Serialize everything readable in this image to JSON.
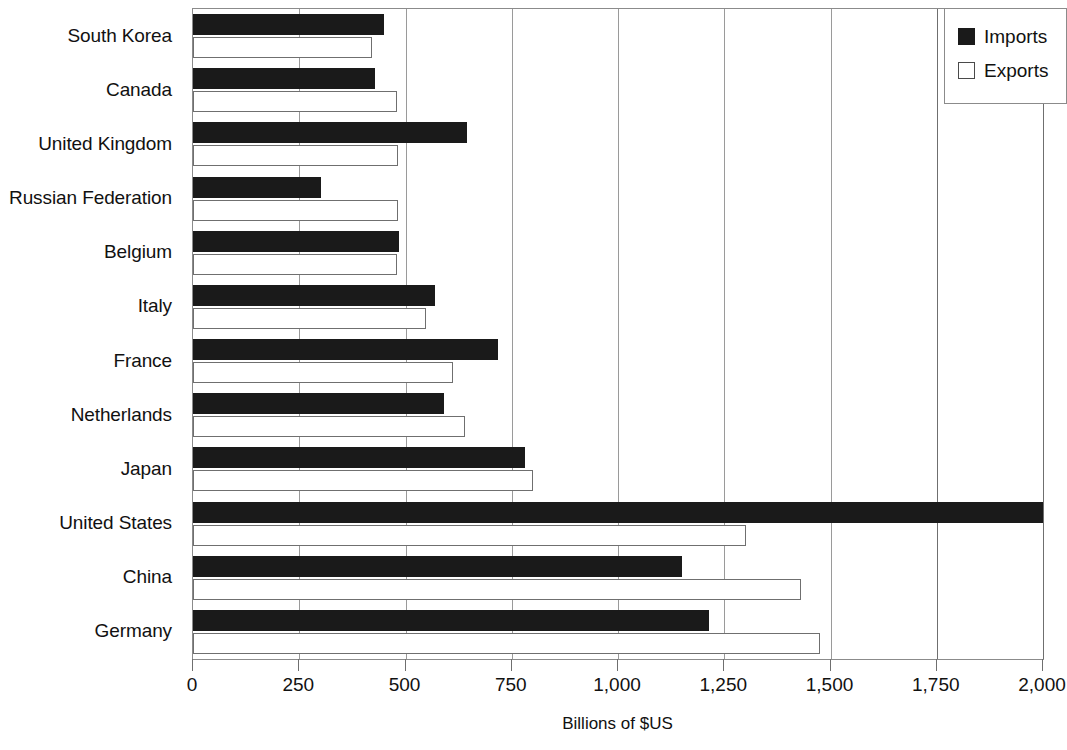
{
  "chart_data": {
    "type": "bar",
    "orientation": "horizontal",
    "title": "",
    "xlabel": "Billions of $US",
    "ylabel": "",
    "xlim": [
      0,
      2000
    ],
    "xticks": [
      0,
      250,
      500,
      750,
      1000,
      1250,
      1500,
      1750,
      2000
    ],
    "xtick_labels": [
      "0",
      "250",
      "500",
      "750",
      "1,000",
      "1,250",
      "1,500",
      "1,750",
      "2,000"
    ],
    "grid": true,
    "grid_axis": "x",
    "legend_position": "top-right",
    "categories": [
      "South Korea",
      "Canada",
      "United Kingdom",
      "Russian Federation",
      "Belgium",
      "Italy",
      "France",
      "Netherlands",
      "Japan",
      "United States",
      "China",
      "Germany"
    ],
    "series": [
      {
        "name": "Imports",
        "color": "#1a1a1a",
        "style": "filled",
        "values": [
          450,
          428,
          645,
          302,
          485,
          570,
          718,
          590,
          782,
          2000,
          1150,
          1215
        ]
      },
      {
        "name": "Exports",
        "color": "#ffffff",
        "style": "hollow",
        "values": [
          420,
          480,
          483,
          482,
          480,
          548,
          611,
          640,
          800,
          1300,
          1430,
          1475
        ]
      }
    ]
  }
}
